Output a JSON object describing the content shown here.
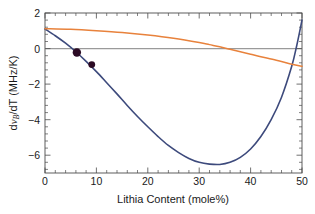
{
  "chart_data": {
    "type": "line",
    "title": "",
    "xlabel": "Lithia Content (mole%)",
    "ylabel": "dνB/dT (MHz/K)",
    "ylabel_parts": {
      "prefix": "d",
      "symbol": "ν",
      "subscript": "B",
      "suffix": "/dT (MHz/K)"
    },
    "xlim": [
      0,
      50
    ],
    "ylim": [
      -7,
      2
    ],
    "xticks": [
      0,
      10,
      20,
      30,
      40,
      50
    ],
    "xticklabels": [
      "0",
      "10",
      "20",
      "30",
      "40",
      "50"
    ],
    "yticks": [
      2,
      0,
      -2,
      -4,
      -6
    ],
    "yticklabels": [
      "2",
      "0",
      "−2",
      "−4",
      "−6"
    ],
    "grid": false,
    "legend": "none",
    "zero_line": true,
    "series": [
      {
        "name": "blue-curve",
        "color": "#3d4a7c",
        "linewidth": 1.6,
        "x": [
          0,
          2,
          4,
          6,
          8,
          10,
          12,
          14,
          16,
          18,
          20,
          22,
          24,
          26,
          28,
          30,
          32,
          34,
          36,
          38,
          40,
          42,
          44,
          46,
          48,
          49,
          50
        ],
        "values": [
          1.1,
          0.72,
          0.3,
          -0.18,
          -0.72,
          -1.3,
          -1.92,
          -2.55,
          -3.2,
          -3.82,
          -4.4,
          -4.95,
          -5.45,
          -5.85,
          -6.18,
          -6.4,
          -6.5,
          -6.52,
          -6.4,
          -6.12,
          -5.65,
          -4.95,
          -4.0,
          -2.75,
          -1.0,
          0.2,
          1.6
        ]
      },
      {
        "name": "orange-curve",
        "color": "#e8823c",
        "linewidth": 1.5,
        "x": [
          0,
          5,
          10,
          15,
          20,
          25,
          30,
          32,
          34,
          36,
          38,
          40,
          42,
          45,
          48,
          50
        ],
        "values": [
          1.12,
          1.08,
          1.0,
          0.9,
          0.76,
          0.58,
          0.34,
          0.22,
          0.1,
          -0.04,
          -0.18,
          -0.32,
          -0.46,
          -0.66,
          -0.88,
          -1.0
        ]
      }
    ],
    "points": [
      {
        "name": "data-point-1",
        "x": 6.2,
        "y": -0.22,
        "color": "#2b0a24",
        "radius": 4.2
      },
      {
        "name": "data-point-2",
        "x": 9.1,
        "y": -0.9,
        "color": "#2b0a24",
        "radius": 3.4
      }
    ]
  }
}
